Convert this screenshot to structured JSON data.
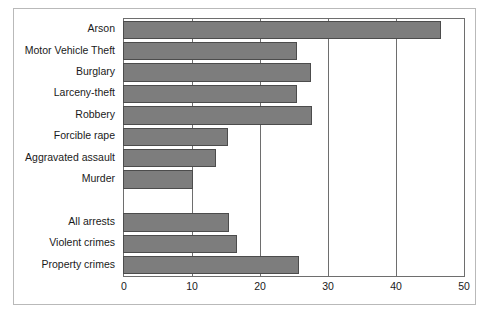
{
  "chart_data": {
    "type": "bar",
    "orientation": "horizontal",
    "title": "",
    "subtitle": "",
    "xlabel": "",
    "ylabel": "",
    "xlim": [
      0,
      50
    ],
    "xticks": [
      0,
      10,
      20,
      30,
      40,
      50
    ],
    "xtick_labels": [
      "0",
      "10",
      "20",
      "30",
      "40",
      "50"
    ],
    "grid": true,
    "grid_axis": "x",
    "legend": false,
    "legend_position": "none",
    "bar_color": "#7d7d7d",
    "bar_edge_color": "#4c4c4c",
    "axis_color": "#6e6e6e",
    "background_color": "#ffffff",
    "frame_color": "#b9b9b9",
    "categories": [
      "Arson",
      "Motor Vehicle Theft",
      "Burglary",
      "Larceny-theft",
      "Robbery",
      "Forcible rape",
      "Aggravated assault",
      "Murder",
      "",
      "All arrests",
      "Violent crimes",
      "Property crimes"
    ],
    "values": [
      46.6,
      25.4,
      27.5,
      25.4,
      27.6,
      15.3,
      13.5,
      10.2,
      null,
      15.4,
      16.6,
      25.8
    ],
    "bars": [
      {
        "category": "Arson",
        "value": 46.6
      },
      {
        "category": "Motor Vehicle Theft",
        "value": 25.4
      },
      {
        "category": "Burglary",
        "value": 27.5
      },
      {
        "category": "Larceny-theft",
        "value": 25.4
      },
      {
        "category": "Robbery",
        "value": 27.6
      },
      {
        "category": "Forcible rape",
        "value": 15.3
      },
      {
        "category": "Aggravated assault",
        "value": 13.5
      },
      {
        "category": "Murder",
        "value": 10.2
      },
      {
        "category": "",
        "value": null
      },
      {
        "category": "All arrests",
        "value": 15.4
      },
      {
        "category": "Violent crimes",
        "value": 16.6
      },
      {
        "category": "Property crimes",
        "value": 25.8
      }
    ]
  }
}
